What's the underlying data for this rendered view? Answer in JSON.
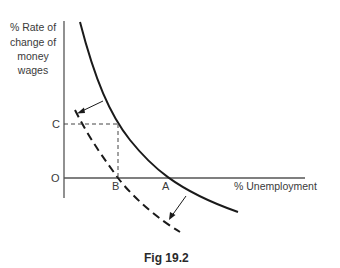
{
  "figure": {
    "caption": "Fig 19.2",
    "y_axis_label": [
      "% Rate of",
      "change of",
      "money",
      "wages"
    ],
    "x_axis_label": "% Unemployment",
    "points": {
      "origin": "O",
      "c": "C",
      "b": "B",
      "a": "A"
    },
    "curves": [
      {
        "name": "original-phillips-curve",
        "style": "solid"
      },
      {
        "name": "shifted-phillips-curve",
        "style": "dashed"
      }
    ],
    "arrows": [
      {
        "name": "shift-arrow-upper",
        "direction": "down-left"
      },
      {
        "name": "shift-arrow-lower",
        "direction": "down-left"
      }
    ],
    "colors": {
      "line": "#1a1a1a",
      "axis": "#555555",
      "text": "#3a3a3a"
    }
  }
}
